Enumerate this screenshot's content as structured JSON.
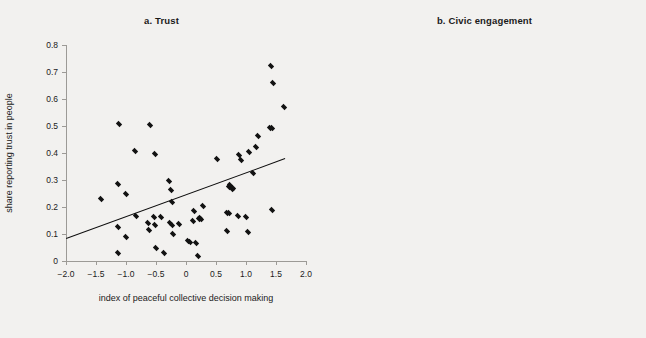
{
  "figure": {
    "background_color": "#f2f1ef",
    "marker_color": "#121212",
    "axis_color": "#9c9a96",
    "fitline_color": "#0d0d0d"
  },
  "chart_data": [
    {
      "type": "scatter",
      "panel_id": "a",
      "title": "a.  Trust",
      "xlabel": "index of peaceful collective decision making",
      "ylabel": "share reporting trust in people",
      "xlim": [
        -2.0,
        2.0
      ],
      "ylim": [
        0.0,
        0.8
      ],
      "xticks": [
        -2.0,
        -1.5,
        -1.0,
        -0.5,
        0,
        0.5,
        1.0,
        1.5,
        2.0
      ],
      "xticklabels": [
        "−2.0",
        "−1.5",
        "−1.0",
        "−0.5",
        "0",
        "0.5",
        "1.0",
        "1.5",
        "2.0"
      ],
      "yticks": [
        0,
        0.1,
        0.2,
        0.3,
        0.4,
        0.5,
        0.6,
        0.7,
        0.8
      ],
      "yticklabels": [
        "0",
        "0.1",
        "0.2",
        "0.3",
        "0.4",
        "0.5",
        "0.6",
        "0.7",
        "0.8"
      ],
      "grid": false,
      "legend": "none",
      "fit_line": {
        "label": "linear fit",
        "x": [
          -2.0,
          1.65
        ],
        "y": [
          0.086,
          0.382
        ]
      },
      "points": [
        [
          -1.41,
          0.228
        ],
        [
          -1.14,
          0.284
        ],
        [
          -1.13,
          0.127
        ],
        [
          -1.14,
          0.031
        ],
        [
          -1.12,
          0.506
        ],
        [
          -1.0,
          0.25
        ],
        [
          -1.0,
          0.09
        ],
        [
          -0.85,
          0.409
        ],
        [
          -0.84,
          0.168
        ],
        [
          -0.63,
          0.14
        ],
        [
          -0.62,
          0.115
        ],
        [
          -0.6,
          0.505
        ],
        [
          -0.54,
          0.163
        ],
        [
          -0.52,
          0.135
        ],
        [
          -0.51,
          0.397
        ],
        [
          -0.5,
          0.048
        ],
        [
          -0.41,
          0.163
        ],
        [
          -0.37,
          0.031
        ],
        [
          -0.28,
          0.296
        ],
        [
          -0.27,
          0.139
        ],
        [
          -0.25,
          0.264
        ],
        [
          -0.24,
          0.135
        ],
        [
          -0.23,
          0.218
        ],
        [
          -0.22,
          0.099
        ],
        [
          -0.12,
          0.136
        ],
        [
          0.04,
          0.075
        ],
        [
          0.07,
          0.071
        ],
        [
          0.11,
          0.15
        ],
        [
          0.13,
          0.186
        ],
        [
          0.17,
          0.066
        ],
        [
          0.2,
          0.018
        ],
        [
          0.22,
          0.157
        ],
        [
          0.24,
          0.16
        ],
        [
          0.25,
          0.155
        ],
        [
          0.29,
          0.202
        ],
        [
          0.52,
          0.379
        ],
        [
          0.68,
          0.177
        ],
        [
          0.69,
          0.112
        ],
        [
          0.71,
          0.179
        ],
        [
          0.72,
          0.275
        ],
        [
          0.74,
          0.281
        ],
        [
          0.76,
          0.265
        ],
        [
          0.78,
          0.27
        ],
        [
          0.87,
          0.167
        ],
        [
          0.89,
          0.394
        ],
        [
          0.92,
          0.374
        ],
        [
          1.0,
          0.164
        ],
        [
          1.03,
          0.106
        ],
        [
          1.05,
          0.404
        ],
        [
          1.12,
          0.325
        ],
        [
          1.16,
          0.424
        ],
        [
          1.2,
          0.463
        ],
        [
          1.4,
          0.493
        ],
        [
          1.42,
          0.722
        ],
        [
          1.43,
          0.189
        ],
        [
          1.44,
          0.493
        ],
        [
          1.45,
          0.661
        ],
        [
          1.64,
          0.569
        ]
      ]
    },
    {
      "type": "scatter",
      "panel_id": "b",
      "title": "b.  Civic engagement",
      "xlabel": "index of peaceful collective decision making",
      "ylabel": "index of civic engagement",
      "xlim": [
        -1.5,
        2.0
      ],
      "ylim": [
        0.0,
        0.9
      ],
      "xticks": [
        -1.5,
        -1.0,
        -0.5,
        0,
        0.5,
        1.0,
        1.5,
        2.0
      ],
      "xticklabels": [
        "−1.5",
        "−1.0",
        "−0.5",
        "0",
        "0.5",
        "1.0",
        "1.5",
        "2.0"
      ],
      "yticks": [
        0,
        0.1,
        0.2,
        0.3,
        0.4,
        0.5,
        0.6,
        0.7,
        0.8,
        0.9
      ],
      "yticklabels": [
        "0",
        "0.1",
        "0.2",
        "0.3",
        "0.4",
        "0.5",
        "0.6",
        "0.7",
        "0.8",
        "0.9"
      ],
      "grid": false,
      "legend": "none",
      "fit_line": {
        "label": "linear fit",
        "x": [
          -1.42,
          1.47
        ],
        "y": [
          0.336,
          0.668
        ]
      },
      "points": [
        [
          -1.42,
          0.612
        ],
        [
          -1.2,
          0.534
        ],
        [
          -1.15,
          0.479
        ],
        [
          -1.14,
          0.414
        ],
        [
          -1.12,
          0.268
        ],
        [
          -0.97,
          0.089
        ],
        [
          -0.86,
          0.458
        ],
        [
          -0.66,
          0.316
        ],
        [
          -0.6,
          0.554
        ],
        [
          -0.53,
          0.26
        ],
        [
          -0.52,
          0.428
        ],
        [
          -0.51,
          0.22
        ],
        [
          -0.49,
          0.22
        ],
        [
          -0.47,
          0.387
        ],
        [
          -0.4,
          0.081
        ],
        [
          -0.38,
          0.645
        ],
        [
          -0.36,
          0.281
        ],
        [
          -0.32,
          0.276
        ],
        [
          -0.3,
          0.275
        ],
        [
          -0.29,
          0.5
        ],
        [
          -0.27,
          0.592
        ],
        [
          -0.23,
          0.596
        ],
        [
          -0.13,
          0.657
        ],
        [
          0.09,
          0.282
        ],
        [
          0.1,
          0.49
        ],
        [
          0.12,
          0.5
        ],
        [
          0.14,
          0.659
        ],
        [
          0.19,
          0.243
        ],
        [
          0.2,
          0.572
        ],
        [
          0.21,
          0.662
        ],
        [
          0.22,
          0.519
        ],
        [
          0.27,
          0.639
        ],
        [
          0.3,
          0.291
        ],
        [
          0.5,
          0.75
        ],
        [
          0.64,
          0.365
        ],
        [
          0.66,
          0.491
        ],
        [
          0.7,
          0.613
        ],
        [
          0.72,
          0.537
        ],
        [
          0.76,
          0.697
        ],
        [
          0.82,
          0.385
        ],
        [
          0.88,
          0.634
        ],
        [
          0.93,
          0.501
        ],
        [
          1.0,
          0.536
        ],
        [
          1.03,
          0.378
        ],
        [
          1.09,
          0.579
        ],
        [
          1.17,
          0.724
        ],
        [
          1.2,
          0.726
        ],
        [
          1.3,
          0.624
        ],
        [
          1.33,
          0.63
        ],
        [
          1.38,
          0.727
        ],
        [
          1.41,
          0.724
        ],
        [
          1.43,
          0.718
        ],
        [
          1.44,
          0.69
        ],
        [
          1.63,
          0.562
        ]
      ]
    }
  ]
}
